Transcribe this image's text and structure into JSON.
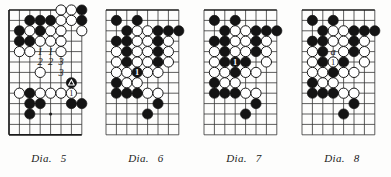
{
  "page": {
    "background_color": "#fdfdfc",
    "ink_color": "#1a1a1a",
    "black_stone_color": "#141414",
    "white_stone_color": "#ffffff",
    "diagram_count": 4
  },
  "grid": {
    "spacing": 10.4,
    "cols": 8,
    "rows": 13,
    "origin_x": 9,
    "origin_y": 10,
    "stone_radius": 5.1,
    "line_color": "#333333",
    "edge_line_color": "#1a1a1a"
  },
  "diagrams": [
    {
      "id": "dia-5",
      "caption_label": "Dia.",
      "caption_number": "5",
      "edges": {
        "top": true,
        "left": true,
        "bottom": true,
        "right": false
      },
      "star_points": [
        {
          "c": 4,
          "r": 10
        }
      ],
      "black_stones": [
        {
          "c": 7,
          "r": 0
        },
        {
          "c": 2,
          "r": 1
        },
        {
          "c": 3,
          "r": 1
        },
        {
          "c": 4,
          "r": 1
        },
        {
          "c": 7,
          "r": 1
        },
        {
          "c": 1,
          "r": 2
        },
        {
          "c": 3,
          "r": 2
        },
        {
          "c": 1,
          "r": 3
        },
        {
          "c": 2,
          "r": 3
        },
        {
          "c": 2,
          "r": 8
        },
        {
          "c": 2,
          "r": 9
        },
        {
          "c": 3,
          "r": 9
        },
        {
          "c": 6,
          "r": 9
        },
        {
          "c": 7,
          "r": 9
        },
        {
          "c": 2,
          "r": 10
        }
      ],
      "white_stones": [
        {
          "c": 5,
          "r": 0
        },
        {
          "c": 6,
          "r": 0
        },
        {
          "c": 5,
          "r": 1
        },
        {
          "c": 6,
          "r": 1
        },
        {
          "c": 2,
          "r": 2
        },
        {
          "c": 4,
          "r": 2
        },
        {
          "c": 5,
          "r": 2
        },
        {
          "c": 7,
          "r": 2
        },
        {
          "c": 3,
          "r": 3
        },
        {
          "c": 4,
          "r": 3
        },
        {
          "c": 5,
          "r": 3
        },
        {
          "c": 1,
          "r": 4
        },
        {
          "c": 2,
          "r": 4
        },
        {
          "c": 5,
          "r": 4
        },
        {
          "c": 3,
          "r": 6
        },
        {
          "c": 1,
          "r": 8
        },
        {
          "c": 3,
          "r": 8
        },
        {
          "c": 4,
          "r": 8
        },
        {
          "c": 5,
          "r": 8
        }
      ],
      "numbered_white_stones": [
        {
          "c": 6,
          "r": 8,
          "label": "1"
        }
      ],
      "numbered_black_stones": [],
      "triangle_black_stones": [
        {
          "c": 6,
          "r": 7
        }
      ],
      "text_labels": [
        {
          "c": 3,
          "r": 4,
          "text": "1"
        },
        {
          "c": 4,
          "r": 4,
          "text": "1"
        },
        {
          "c": 3,
          "r": 5,
          "text": "2"
        },
        {
          "c": 4,
          "r": 5,
          "text": "2"
        },
        {
          "c": 5,
          "r": 5,
          "text": "3"
        },
        {
          "c": 5,
          "r": 6,
          "text": "3"
        }
      ]
    },
    {
      "id": "dia-6",
      "caption_label": "Dia.",
      "caption_number": "6",
      "edges": {
        "top": true,
        "left": false,
        "bottom": false,
        "right": false
      },
      "star_points": [
        {
          "c": 4,
          "r": 10
        }
      ],
      "black_stones": [
        {
          "c": 1,
          "r": 1
        },
        {
          "c": 3,
          "r": 1
        },
        {
          "c": 2,
          "r": 2
        },
        {
          "c": 5,
          "r": 2
        },
        {
          "c": 6,
          "r": 2
        },
        {
          "c": 7,
          "r": 2
        },
        {
          "c": 1,
          "r": 3
        },
        {
          "c": 2,
          "r": 3
        },
        {
          "c": 5,
          "r": 3
        },
        {
          "c": 2,
          "r": 4
        },
        {
          "c": 5,
          "r": 4
        },
        {
          "c": 2,
          "r": 5
        },
        {
          "c": 5,
          "r": 5
        },
        {
          "c": 1,
          "r": 7
        },
        {
          "c": 1,
          "r": 8
        },
        {
          "c": 2,
          "r": 8
        },
        {
          "c": 3,
          "r": 8
        },
        {
          "c": 5,
          "r": 9
        },
        {
          "c": 4,
          "r": 10
        }
      ],
      "white_stones": [
        {
          "c": 3,
          "r": 2
        },
        {
          "c": 4,
          "r": 2
        },
        {
          "c": 3,
          "r": 3
        },
        {
          "c": 4,
          "r": 3
        },
        {
          "c": 6,
          "r": 3
        },
        {
          "c": 1,
          "r": 4
        },
        {
          "c": 3,
          "r": 4
        },
        {
          "c": 4,
          "r": 4
        },
        {
          "c": 6,
          "r": 4
        },
        {
          "c": 1,
          "r": 5
        },
        {
          "c": 3,
          "r": 5
        },
        {
          "c": 4,
          "r": 5
        },
        {
          "c": 6,
          "r": 5
        },
        {
          "c": 1,
          "r": 6
        },
        {
          "c": 2,
          "r": 6
        },
        {
          "c": 4,
          "r": 6
        },
        {
          "c": 5,
          "r": 6
        },
        {
          "c": 2,
          "r": 7
        },
        {
          "c": 3,
          "r": 7
        },
        {
          "c": 4,
          "r": 8
        },
        {
          "c": 5,
          "r": 8
        }
      ],
      "numbered_white_stones": [],
      "numbered_black_stones": [
        {
          "c": 3,
          "r": 6,
          "label": "1"
        }
      ],
      "triangle_black_stones": [],
      "text_labels": []
    },
    {
      "id": "dia-7",
      "caption_label": "Dia.",
      "caption_number": "7",
      "edges": {
        "top": true,
        "left": false,
        "bottom": false,
        "right": false
      },
      "star_points": [
        {
          "c": 4,
          "r": 3
        },
        {
          "c": 4,
          "r": 10
        }
      ],
      "black_stones": [
        {
          "c": 1,
          "r": 1
        },
        {
          "c": 3,
          "r": 1
        },
        {
          "c": 2,
          "r": 2
        },
        {
          "c": 5,
          "r": 2
        },
        {
          "c": 6,
          "r": 2
        },
        {
          "c": 7,
          "r": 2
        },
        {
          "c": 1,
          "r": 3
        },
        {
          "c": 2,
          "r": 3
        },
        {
          "c": 5,
          "r": 3
        },
        {
          "c": 2,
          "r": 4
        },
        {
          "c": 5,
          "r": 4
        },
        {
          "c": 2,
          "r": 5
        },
        {
          "c": 4,
          "r": 5
        },
        {
          "c": 3,
          "r": 6
        },
        {
          "c": 1,
          "r": 7
        },
        {
          "c": 1,
          "r": 8
        },
        {
          "c": 2,
          "r": 8
        },
        {
          "c": 3,
          "r": 8
        },
        {
          "c": 5,
          "r": 9
        },
        {
          "c": 4,
          "r": 10
        }
      ],
      "white_stones": [
        {
          "c": 3,
          "r": 2
        },
        {
          "c": 4,
          "r": 2
        },
        {
          "c": 3,
          "r": 3
        },
        {
          "c": 4,
          "r": 3
        },
        {
          "c": 6,
          "r": 3
        },
        {
          "c": 1,
          "r": 4
        },
        {
          "c": 3,
          "r": 4
        },
        {
          "c": 4,
          "r": 4
        },
        {
          "c": 6,
          "r": 4
        },
        {
          "c": 1,
          "r": 5
        },
        {
          "c": 6,
          "r": 5
        },
        {
          "c": 1,
          "r": 6
        },
        {
          "c": 2,
          "r": 6
        },
        {
          "c": 4,
          "r": 6
        },
        {
          "c": 5,
          "r": 6
        },
        {
          "c": 2,
          "r": 7
        },
        {
          "c": 3,
          "r": 7
        },
        {
          "c": 4,
          "r": 8
        },
        {
          "c": 5,
          "r": 8
        }
      ],
      "numbered_white_stones": [],
      "numbered_black_stones": [
        {
          "c": 3,
          "r": 5,
          "label": "1"
        }
      ],
      "triangle_black_stones": [],
      "text_labels": []
    },
    {
      "id": "dia-8",
      "caption_label": "Dia.",
      "caption_number": "8",
      "edges": {
        "top": true,
        "left": false,
        "bottom": false,
        "right": false
      },
      "star_points": [
        {
          "c": 4,
          "r": 3
        },
        {
          "c": 4,
          "r": 10
        }
      ],
      "black_stones": [
        {
          "c": 1,
          "r": 1
        },
        {
          "c": 3,
          "r": 1
        },
        {
          "c": 2,
          "r": 2
        },
        {
          "c": 5,
          "r": 2
        },
        {
          "c": 6,
          "r": 2
        },
        {
          "c": 7,
          "r": 2
        },
        {
          "c": 1,
          "r": 3
        },
        {
          "c": 2,
          "r": 3
        },
        {
          "c": 5,
          "r": 3
        },
        {
          "c": 2,
          "r": 4
        },
        {
          "c": 5,
          "r": 4
        },
        {
          "c": 2,
          "r": 5
        },
        {
          "c": 4,
          "r": 5
        },
        {
          "c": 3,
          "r": 6
        },
        {
          "c": 1,
          "r": 7
        },
        {
          "c": 1,
          "r": 8
        },
        {
          "c": 2,
          "r": 8
        },
        {
          "c": 3,
          "r": 8
        },
        {
          "c": 5,
          "r": 9
        },
        {
          "c": 4,
          "r": 10
        }
      ],
      "white_stones": [
        {
          "c": 3,
          "r": 2
        },
        {
          "c": 4,
          "r": 2
        },
        {
          "c": 3,
          "r": 3
        },
        {
          "c": 4,
          "r": 3
        },
        {
          "c": 6,
          "r": 3
        },
        {
          "c": 1,
          "r": 4
        },
        {
          "c": 4,
          "r": 4
        },
        {
          "c": 6,
          "r": 4
        },
        {
          "c": 1,
          "r": 5
        },
        {
          "c": 6,
          "r": 5
        },
        {
          "c": 1,
          "r": 6
        },
        {
          "c": 2,
          "r": 6
        },
        {
          "c": 4,
          "r": 6
        },
        {
          "c": 5,
          "r": 6
        },
        {
          "c": 2,
          "r": 7
        },
        {
          "c": 3,
          "r": 7
        },
        {
          "c": 4,
          "r": 8
        },
        {
          "c": 5,
          "r": 8
        }
      ],
      "numbered_white_stones": [
        {
          "c": 3,
          "r": 5,
          "label": "1"
        }
      ],
      "numbered_black_stones": [],
      "triangle_black_stones": [],
      "text_labels": [
        {
          "c": 3,
          "r": 4,
          "text": "a"
        }
      ]
    }
  ],
  "layout": {
    "diagram_x_positions": [
      0,
      97,
      195,
      293
    ]
  }
}
